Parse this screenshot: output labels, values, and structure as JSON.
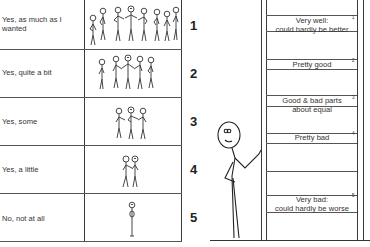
{
  "scale_table": {
    "rows": [
      {
        "label": "Yes, as much as I wanted",
        "number": "1",
        "figure_count": 8,
        "icon": "large-group-stick-figures-icon"
      },
      {
        "label": "Yes, quite a bit",
        "number": "2",
        "figure_count": 5,
        "icon": "group-holding-hands-icon"
      },
      {
        "label": "Yes, some",
        "number": "3",
        "figure_count": 3,
        "icon": "small-group-stick-figures-icon"
      },
      {
        "label": "Yes, a little",
        "number": "4",
        "figure_count": 2,
        "icon": "pair-stick-figures-icon"
      },
      {
        "label": "No, not  at all",
        "number": "5",
        "figure_count": 1,
        "icon": "single-stick-figure-icon"
      }
    ]
  },
  "ladder": {
    "rungs": [
      {
        "label_line1": "Very well:",
        "label_line2": "could hardly be better",
        "number": "1"
      },
      {
        "label_line1": "Pretty good",
        "label_line2": "",
        "number": "2"
      },
      {
        "label_line1": "Good & bad parts",
        "label_line2": "about equal",
        "number": "3"
      },
      {
        "label_line1": "Pretty bad",
        "label_line2": "",
        "number": "4"
      },
      {
        "label_line1": "Very bad:",
        "label_line2": "could hardly be worse",
        "number": "5"
      }
    ],
    "figure_icon": "smiling-stick-figure-leaning-on-ladder-icon"
  },
  "colors": {
    "line": "#3a3a3a",
    "text": "#2a2a2a",
    "background": "#ffffff"
  }
}
